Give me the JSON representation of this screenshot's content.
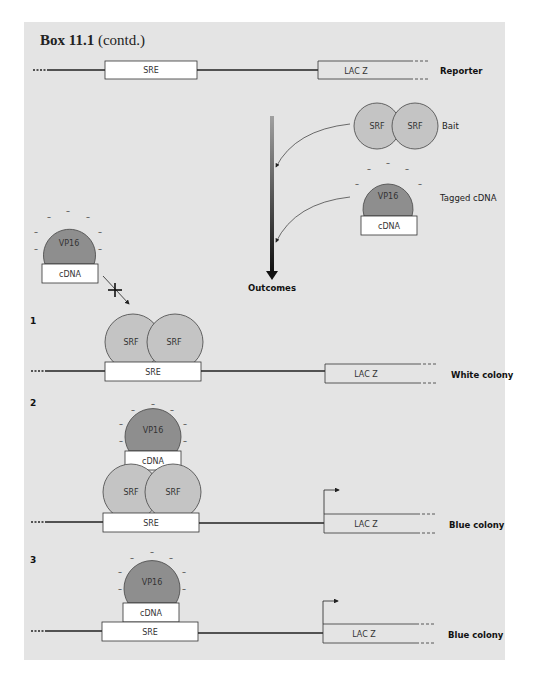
{
  "box": {
    "title_bold": "Box 11.1",
    "title_suffix": "(contd.)"
  },
  "labels": {
    "sre": "SRE",
    "lacz": "LAC Z",
    "srf": "SRF",
    "vp16": "VP16",
    "cdna": "cDNA",
    "minus": "–"
  },
  "legend": {
    "reporter": "Reporter",
    "bait": "Bait",
    "tagged_cdna": "Tagged cDNA",
    "outcomes": "Outcomes"
  },
  "scenarios": [
    {
      "number": "1",
      "result": "White colony"
    },
    {
      "number": "2",
      "result": "Blue colony"
    },
    {
      "number": "3",
      "result": "Blue colony"
    }
  ],
  "colors": {
    "panel_bg": "#e4e4e4",
    "srf_fill": "#c4c4c4",
    "vp16_fill": "#8e8e8e",
    "box_fill": "#ffffff",
    "line": "#222222"
  }
}
